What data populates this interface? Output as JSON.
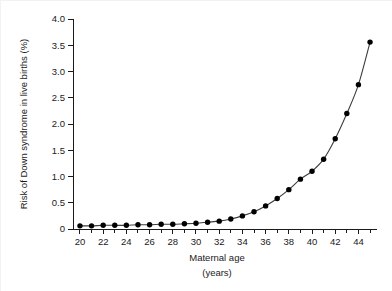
{
  "chart_data": {
    "type": "line",
    "title": "",
    "xlabel": "Maternal age",
    "xlabel_units": "(years)",
    "ylabel": "Risk of Down syndrome in live births (%)",
    "xlim": [
      19.4,
      45.6
    ],
    "ylim": [
      0,
      4.0
    ],
    "grid": false,
    "legend": "none",
    "marker": "filled-circle",
    "line_color": "#3d3d3d",
    "marker_color": "#000000",
    "background_color": "#ffffff",
    "x_major_tick_labels": [
      "20",
      "22",
      "24",
      "26",
      "28",
      "30",
      "32",
      "34",
      "36",
      "38",
      "40",
      "42",
      "44"
    ],
    "x_major_tick_values": [
      20,
      22,
      24,
      26,
      28,
      30,
      32,
      34,
      36,
      38,
      40,
      42,
      44
    ],
    "x_minor_tick_values": [
      21,
      23,
      25,
      27,
      29,
      31,
      33,
      35,
      37,
      39,
      41,
      43,
      45
    ],
    "y_tick_labels": [
      "0",
      "0.5",
      "1.0",
      "1.5",
      "2.0",
      "2.5",
      "3.0",
      "3.5",
      "4.0"
    ],
    "y_tick_values": [
      0,
      0.5,
      1.0,
      1.5,
      2.0,
      2.5,
      3.0,
      3.5,
      4.0
    ],
    "x": [
      20,
      21,
      22,
      23,
      24,
      25,
      26,
      27,
      28,
      29,
      30,
      31,
      32,
      33,
      34,
      35,
      36,
      37,
      38,
      39,
      40,
      41,
      42,
      43,
      44,
      45
    ],
    "values": [
      0.06,
      0.06,
      0.07,
      0.07,
      0.07,
      0.08,
      0.08,
      0.09,
      0.09,
      0.1,
      0.11,
      0.13,
      0.15,
      0.19,
      0.25,
      0.33,
      0.44,
      0.58,
      0.75,
      0.95,
      1.1,
      1.33,
      1.72,
      2.2,
      2.75,
      3.56
    ],
    "series": [
      {
        "name": "Risk of Down syndrome in live births",
        "values": [
          0.06,
          0.06,
          0.07,
          0.07,
          0.07,
          0.08,
          0.08,
          0.09,
          0.09,
          0.1,
          0.11,
          0.13,
          0.15,
          0.19,
          0.25,
          0.33,
          0.44,
          0.58,
          0.75,
          0.95,
          1.1,
          1.33,
          1.72,
          2.2,
          2.75,
          3.56
        ]
      }
    ]
  }
}
